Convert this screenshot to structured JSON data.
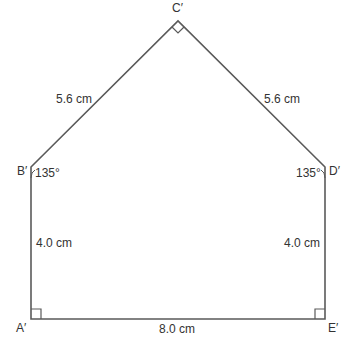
{
  "figure": {
    "type": "pentagon",
    "stroke_color": "#5a5a5a",
    "vertices": {
      "A": {
        "label": "A′",
        "x": 31,
        "y": 319
      },
      "B": {
        "label": "B′",
        "x": 31,
        "y": 167
      },
      "C": {
        "label": "C′",
        "x": 178,
        "y": 21
      },
      "D": {
        "label": "D′",
        "x": 325,
        "y": 167
      },
      "E": {
        "label": "E′",
        "x": 325,
        "y": 319
      }
    },
    "side_labels": {
      "BC": "5.6 cm",
      "CD": "5.6 cm",
      "AB": "4.0 cm",
      "DE": "4.0 cm",
      "AE": "8.0 cm"
    },
    "angle_labels": {
      "B": "135°",
      "D": "135°"
    },
    "right_angles": [
      "A",
      "C",
      "E"
    ]
  }
}
